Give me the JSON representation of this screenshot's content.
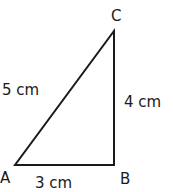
{
  "diagram": {
    "type": "right-triangle",
    "stroke_color": "#1a1a1a",
    "vertices": {
      "A": {
        "label": "A",
        "x": 15,
        "y": 165
      },
      "B": {
        "label": "B",
        "x": 114,
        "y": 165
      },
      "C": {
        "label": "C",
        "x": 114,
        "y": 31
      }
    },
    "sides": {
      "AB": {
        "label": "3 cm"
      },
      "BC": {
        "label": "4 cm"
      },
      "AC": {
        "label": "5 cm"
      }
    }
  }
}
